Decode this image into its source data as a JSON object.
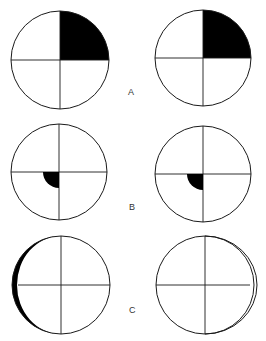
{
  "figure": {
    "colors": {
      "stroke": "#1a1a1a",
      "fill": "#000000",
      "background": "#ffffff"
    },
    "rows": [
      {
        "label": "A",
        "left": {
          "shading": "upper-right quadrant filled black"
        },
        "right": {
          "shading": "upper-right quadrant filled black"
        }
      },
      {
        "label": "B",
        "left": {
          "shading": "small black quarter-disc at center, lower-left quadrant"
        },
        "right": {
          "shading": "small black quarter-disc at center, lower-left quadrant"
        }
      },
      {
        "label": "C",
        "left": {
          "shading": "black crescent on left edge"
        },
        "right": {
          "shading": "outlined (unfilled) crescent on right edge"
        }
      }
    ]
  }
}
